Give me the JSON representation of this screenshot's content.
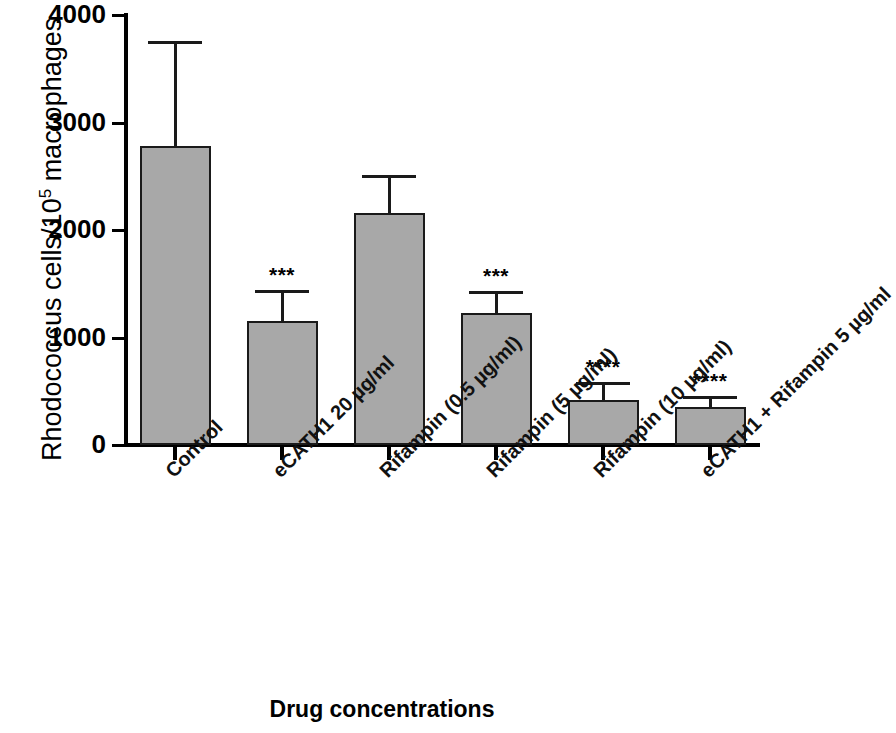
{
  "chart_data": {
    "type": "bar",
    "title": "",
    "xlabel": "Drug concentrations",
    "ylabel_text": "Rhodococcus cells/10",
    "ylabel_sup": "5",
    "ylabel_tail": " macrophages",
    "ylabel_full": "Rhodococcus cells/10^5 macrophages",
    "categories": [
      "Control",
      "eCATH1 20 µg/ml",
      "Rifampin (0.5 µg/ml)",
      "Rifampin (5 µg/ml)",
      "Rifampin (10 µg/ml)",
      "eCATH1 + Rifampin 5 µg/ml"
    ],
    "values": [
      2780,
      1150,
      2160,
      1230,
      420,
      350
    ],
    "errors": [
      980,
      290,
      350,
      200,
      165,
      105
    ],
    "significance": [
      "",
      "***",
      "",
      "***",
      "****",
      "****"
    ],
    "ylim": [
      0,
      4000
    ],
    "yticks": [
      0,
      1000,
      2000,
      3000,
      4000
    ],
    "ytick_labels": [
      "0",
      "1000",
      "2000",
      "3000",
      "4000"
    ],
    "grid": false,
    "legend": "none",
    "bar_color": "#a8a8a8",
    "bar_edge_color": "#1a1a1a",
    "error_color": "#1a1a1a"
  }
}
